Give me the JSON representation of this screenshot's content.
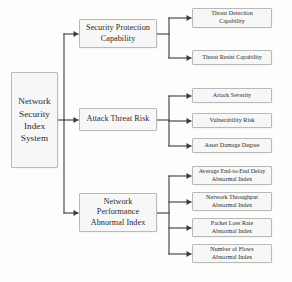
{
  "diagram": {
    "title": "Network Security Index System",
    "type": "hierarchy-tree",
    "orientation": "left-to-right",
    "colors": {
      "box_fill": "#f7f7f7",
      "box_border": "#b9b9b9",
      "connector": "#3b3b3b",
      "text": "#2b2b2b",
      "background": "#fdfdfc"
    },
    "root": {
      "id": "network-security-index-system",
      "label": "Network\nSecurity\nIndex\nSystem",
      "x": 11,
      "y": 72,
      "w": 47,
      "h": 96
    },
    "branches": [
      {
        "id": "security-protection-capability",
        "label": "Security Protection\nCapability",
        "x": 79,
        "y": 19,
        "w": 78,
        "h": 29,
        "children": [
          {
            "id": "threat-detection-capability",
            "label": "Threat Detection\nCapability",
            "x": 192,
            "y": 8,
            "w": 80,
            "h": 20
          },
          {
            "id": "threat-resist-capability",
            "label": "Threat Resist Capability",
            "x": 192,
            "y": 50,
            "w": 80,
            "h": 15
          }
        ]
      },
      {
        "id": "attack-threat-risk",
        "label": "Attack Threat Risk",
        "x": 79,
        "y": 108,
        "w": 78,
        "h": 23,
        "children": [
          {
            "id": "attack-severity",
            "label": "Attack Severity",
            "x": 192,
            "y": 88,
            "w": 80,
            "h": 15
          },
          {
            "id": "vulnerability-risk",
            "label": "Vulnerability Risk",
            "x": 192,
            "y": 113,
            "w": 80,
            "h": 15
          },
          {
            "id": "asset-damage-degree",
            "label": "Asset Damage Degree",
            "x": 192,
            "y": 138,
            "w": 80,
            "h": 15
          }
        ]
      },
      {
        "id": "network-performance-abnormal-index",
        "label": "Network\nPerformance\nAbnormal Index",
        "x": 79,
        "y": 193,
        "w": 78,
        "h": 39,
        "children": [
          {
            "id": "average-end-to-end-delay-abnormal-index",
            "label": "Average End-to-End Delay\nAbnormal Index",
            "x": 192,
            "y": 166,
            "w": 80,
            "h": 19
          },
          {
            "id": "network-throughput-abnormal-index",
            "label": "Network Throughput\nAbnormal Index",
            "x": 192,
            "y": 192,
            "w": 80,
            "h": 19
          },
          {
            "id": "packet-loss-rate-abnormal-index",
            "label": "Packet Loss Rate\nAbnormal Index",
            "x": 192,
            "y": 218,
            "w": 80,
            "h": 19
          },
          {
            "id": "number-of-flows-abnormal-index",
            "label": "Number of Flows\nAbnormal Index",
            "x": 192,
            "y": 244,
            "w": 80,
            "h": 19
          }
        ]
      }
    ]
  }
}
